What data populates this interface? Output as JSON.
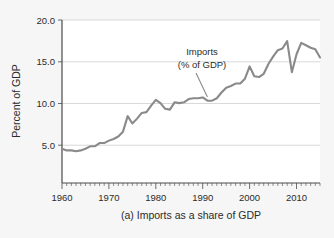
{
  "figure": {
    "background_color": "#f6f6f6",
    "plot_background_color": "#ffffff",
    "line_color": "#8a8a8a",
    "grid_color": "#c8c8c8",
    "axis_color": "#4a4a4a"
  },
  "axes": {
    "ylabel": "Percent of GDP",
    "y_ticks": [
      "5.0",
      "10.0",
      "15.0",
      "20.0"
    ],
    "x_ticks": [
      "1960",
      "1970",
      "1980",
      "1990",
      "2000",
      "2010"
    ]
  },
  "annotation": {
    "line1": "Imports",
    "line2": "(% of GDP)"
  },
  "caption": {
    "text": "(a) Imports as a share of GDP"
  },
  "chart_data": {
    "type": "line",
    "title": "",
    "subtitle": "",
    "xlabel": "",
    "ylabel": "Percent of GDP",
    "xlim": [
      1960,
      2015
    ],
    "ylim": [
      0,
      20
    ],
    "y_tick_values": [
      5.0,
      10.0,
      15.0,
      20.0
    ],
    "x_tick_values": [
      1960,
      1970,
      1980,
      1990,
      2000,
      2010
    ],
    "x_minor_tick_step": 1,
    "grid": "horizontal",
    "legend": "none",
    "annotations": [
      {
        "text": "Imports (% of GDP)",
        "points_to_x": 1991,
        "points_to_y": 10.3
      }
    ],
    "series": [
      {
        "name": "Imports (% of GDP)",
        "color": "#8a8a8a",
        "x": [
          1960,
          1961,
          1962,
          1963,
          1964,
          1965,
          1966,
          1967,
          1968,
          1969,
          1970,
          1971,
          1972,
          1973,
          1974,
          1975,
          1976,
          1977,
          1978,
          1979,
          1980,
          1981,
          1982,
          1983,
          1984,
          1985,
          1986,
          1987,
          1988,
          1989,
          1990,
          1991,
          1992,
          1993,
          1994,
          1995,
          1996,
          1997,
          1998,
          1999,
          2000,
          2001,
          2002,
          2003,
          2004,
          2005,
          2006,
          2007,
          2008,
          2009,
          2010,
          2011,
          2012,
          2013,
          2014,
          2015
        ],
        "values": [
          4.2,
          4.0,
          4.0,
          3.9,
          4.0,
          4.2,
          4.5,
          4.5,
          4.9,
          4.9,
          5.2,
          5.4,
          5.7,
          6.3,
          8.2,
          7.3,
          7.9,
          8.6,
          8.7,
          9.5,
          10.2,
          9.8,
          9.1,
          9.0,
          9.9,
          9.8,
          9.9,
          10.3,
          10.4,
          10.4,
          10.5,
          10.1,
          10.1,
          10.4,
          11.1,
          11.7,
          11.9,
          12.2,
          12.2,
          12.8,
          14.3,
          13.1,
          13.0,
          13.4,
          14.6,
          15.5,
          16.3,
          16.5,
          17.4,
          13.6,
          15.8,
          17.2,
          16.9,
          16.6,
          16.4,
          15.4
        ]
      }
    ]
  }
}
